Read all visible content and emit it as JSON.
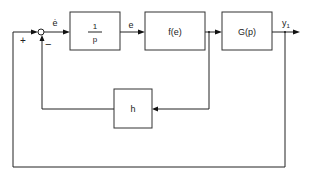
{
  "diagram": {
    "type": "block-diagram",
    "blocks": [
      {
        "id": "integrator",
        "label_num": "1",
        "label_den": "p"
      },
      {
        "id": "nonlinearity",
        "label": "f(e)"
      },
      {
        "id": "plant",
        "label": "G(p)"
      },
      {
        "id": "feedback-gain",
        "label": "h"
      }
    ],
    "signals": {
      "error_rate": "ė",
      "error": "e",
      "output": "y",
      "output_sub": "1"
    },
    "junction_signs": {
      "outer": "+",
      "inner": "−"
    },
    "connections": [
      {
        "from": "summing-junction",
        "to": "integrator",
        "label": "ė"
      },
      {
        "from": "integrator",
        "to": "nonlinearity",
        "label": "e"
      },
      {
        "from": "nonlinearity",
        "to": "plant"
      },
      {
        "from": "plant",
        "to": "output",
        "label": "y1"
      },
      {
        "from": "nonlinearity-output",
        "to": "feedback-gain"
      },
      {
        "from": "feedback-gain",
        "to": "summing-junction",
        "sign": "−"
      },
      {
        "from": "output",
        "to": "summing-junction",
        "sign": "+"
      }
    ]
  }
}
